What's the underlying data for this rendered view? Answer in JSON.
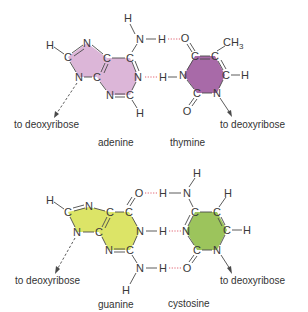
{
  "pairs": [
    {
      "id": "adenine-thymine",
      "left_base": {
        "name": "adenine",
        "fill_color": "#dcb6d8",
        "attachment_label": "to deoxyribose"
      },
      "right_base": {
        "name": "thymine",
        "fill_color": "#a86aa8",
        "attachment_label": "to deoxyribose",
        "methyl_group": "CH3"
      },
      "hydrogen_bonds": 2
    },
    {
      "id": "guanine-cytosine",
      "left_base": {
        "name": "guanine",
        "fill_color": "#dce467",
        "attachment_label": "to deoxyribose"
      },
      "right_base": {
        "name": "cystosine",
        "fill_color": "#9cc45c",
        "attachment_label": "to deoxyribose"
      },
      "hydrogen_bonds": 3
    }
  ],
  "atoms": {
    "H": "H",
    "N": "N",
    "C": "C",
    "O": "O",
    "CH": "CH",
    "sub3": "3"
  },
  "colors": {
    "bond": "#4a4a4a",
    "hydrogen_bond": "#e06070",
    "text": "#3a3a3a"
  }
}
